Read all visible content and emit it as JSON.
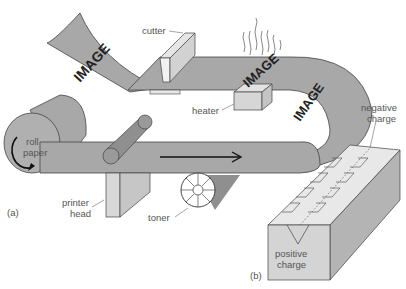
{
  "diagram": {
    "panels": [
      {
        "id": "a",
        "label": "(a)"
      },
      {
        "id": "b",
        "label": "(b)"
      }
    ],
    "labels": {
      "cutter": "cutter",
      "heater": "heater",
      "roll_line1": "roll",
      "roll_line2": "paper",
      "printer_head_line1": "printer",
      "printer_head_line2": "head",
      "toner": "toner",
      "negative_line1": "negative",
      "negative_line2": "charge",
      "positive_line1": "positive",
      "positive_line2": "charge"
    },
    "paper_text": [
      "IMAGE",
      "IMAGE",
      "IMAGE"
    ],
    "colors": {
      "paper": "#a8a8a8",
      "paper_dark": "#8c8c8c",
      "light_box": "#d8d8d8",
      "outline": "#333333",
      "label": "#555555"
    }
  }
}
